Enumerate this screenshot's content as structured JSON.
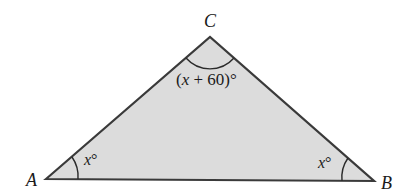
{
  "diagram": {
    "type": "triangle",
    "fill_color": "#dcdcdc",
    "stroke_color": "#3a3a3a",
    "vertices": {
      "A": {
        "label": "A"
      },
      "B": {
        "label": "B"
      },
      "C": {
        "label": "C"
      }
    },
    "angles": {
      "A": {
        "var": "x",
        "suffix": "°"
      },
      "B": {
        "var": "x",
        "suffix": "°"
      },
      "C": {
        "prefix": "(",
        "var": "x",
        "rest": " + 60)°"
      }
    }
  }
}
